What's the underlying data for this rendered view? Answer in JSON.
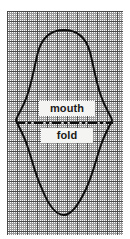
{
  "figure": {
    "type": "sewing-pattern-on-graph-paper",
    "background_color": "#ffffff",
    "paper": {
      "name": "graph-paper",
      "color": "#fdfdfd",
      "minor_line_color": "#9b9b9b",
      "major_line_color": "#4a4a4a",
      "minor_spacing_px": 2,
      "major_spacing_px": 10,
      "left": 7,
      "top": 11,
      "width": 116,
      "height": 224
    },
    "outline": {
      "name": "pattern-outline",
      "stroke_color": "#0d0d0d",
      "stroke_width": 2,
      "closed": true,
      "description": "symmetric lens / leaf shaped closed curve with pointed-ish left and right tips and rounded top and bottom lobes",
      "bounds": {
        "left": 16,
        "top": 30,
        "right": 113,
        "bottom": 216
      },
      "path": "M 64 30 C 78 30 86 38 90 52 C 94 68 96 82 101 96 C 105 108 110 114 112 120 C 110 126 105 133 101 145 C 96 159 93 174 86 189 C 79 204 72 215 64 215 C 56 215 48 204 42 189 C 35 174 32 159 27 145 C 23 133 18 126 16 120 C 18 114 23 108 27 96 C 32 82 34 68 38 52 C 42 38 50 30 64 30 Z"
    },
    "fold_line": {
      "name": "fold-line",
      "style": "dash-dot",
      "color": "#0d0d0d",
      "stroke_width": 2,
      "y": 123,
      "x_start": 16,
      "x_end": 113,
      "dash_pattern": "9 3 3 3"
    },
    "labels": [
      {
        "id": "mouth",
        "text": "mouth",
        "color": "#1a1a1a",
        "background": "#f4f4f2",
        "bold": true,
        "x": 39,
        "y": 101
      },
      {
        "id": "fold",
        "text": "fold",
        "color": "#1a1a1a",
        "background": "#f4f4f2",
        "bold": true,
        "x": 41,
        "y": 128
      }
    ]
  }
}
